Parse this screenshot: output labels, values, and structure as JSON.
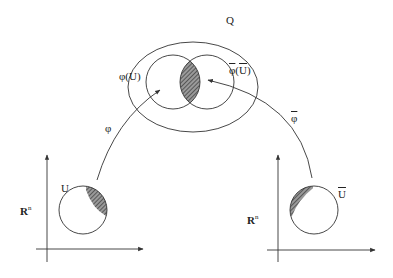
{
  "diagram": {
    "type": "manifold-chart-transition",
    "colors": {
      "stroke": "#333333",
      "hatch": "#555555",
      "background": "#ffffff"
    },
    "labels": {
      "manifold": "Q",
      "left_image": "φ(U)",
      "right_image_phi": "φ",
      "right_image_arg": "(U)",
      "left_map": "φ",
      "right_map": "φ",
      "left_domain": "U",
      "right_domain": "U",
      "left_space": "R",
      "left_space_exp": "n",
      "right_space": "R",
      "right_space_exp": "n"
    },
    "nodes": [
      {
        "id": "Q",
        "shape": "ellipse",
        "label": "Q"
      },
      {
        "id": "phiU",
        "shape": "circle",
        "label": "φ(U)",
        "parent": "Q"
      },
      {
        "id": "phibarUbar",
        "shape": "circle",
        "label": "φ̄(Ū)",
        "parent": "Q"
      },
      {
        "id": "overlap",
        "shape": "lens",
        "hatched": true
      },
      {
        "id": "U",
        "shape": "circle",
        "label": "U",
        "space": "Rn-left"
      },
      {
        "id": "Ubar",
        "shape": "circle",
        "label": "Ū",
        "space": "Rn-right"
      }
    ],
    "edges": [
      {
        "from": "U",
        "to": "phiU",
        "label": "φ"
      },
      {
        "from": "Ubar",
        "to": "phibarUbar",
        "label": "φ̄"
      }
    ]
  }
}
